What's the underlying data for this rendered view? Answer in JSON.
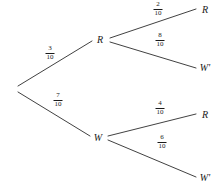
{
  "diagram": {
    "type": "probability-tree",
    "title": "",
    "background_color": "#ffffff",
    "line_color": "#2b2b2b",
    "text_color": "#1a1a1a"
  },
  "nodes": {
    "root": {
      "label": "",
      "x": 15,
      "y": 89
    },
    "level1": [
      {
        "id": "R",
        "label": "R",
        "x": 100,
        "y": 40
      },
      {
        "id": "W",
        "label": "W",
        "x": 98,
        "y": 138
      }
    ],
    "level2": [
      {
        "id": "R-R",
        "label": "R",
        "x": 205,
        "y": 10
      },
      {
        "id": "R-Wp",
        "label": "W'",
        "x": 205,
        "y": 68
      },
      {
        "id": "W-R",
        "label": "R",
        "x": 205,
        "y": 115
      },
      {
        "id": "W-Wp",
        "label": "W'",
        "x": 205,
        "y": 178
      }
    ]
  },
  "branches": [
    {
      "id": "root-to-R",
      "from": "root",
      "to": "R",
      "numerator": "3",
      "denominator": "10",
      "value": 0.3,
      "label_x": 50,
      "label_y": 53,
      "x1": 18,
      "y1": 86,
      "x2": 92,
      "y2": 41
    },
    {
      "id": "root-to-W",
      "from": "root",
      "to": "W",
      "numerator": "7",
      "denominator": "10",
      "value": 0.7,
      "label_x": 58,
      "label_y": 100,
      "x1": 18,
      "y1": 92,
      "x2": 90,
      "y2": 136
    },
    {
      "id": "R-to-R",
      "from": "R",
      "to": "R-R",
      "numerator": "2",
      "denominator": "10",
      "value": 0.2,
      "label_x": 158,
      "label_y": 9,
      "x1": 110,
      "y1": 38,
      "x2": 196,
      "y2": 9
    },
    {
      "id": "R-to-Wp",
      "from": "R",
      "to": "R-Wp",
      "numerator": "8",
      "denominator": "10",
      "value": 0.8,
      "label_x": 160,
      "label_y": 40,
      "x1": 110,
      "y1": 42,
      "x2": 196,
      "y2": 68
    },
    {
      "id": "W-to-R",
      "from": "W",
      "to": "W-R",
      "numerator": "4",
      "denominator": "10",
      "value": 0.4,
      "label_x": 160,
      "label_y": 108,
      "x1": 108,
      "y1": 136,
      "x2": 196,
      "y2": 114
    },
    {
      "id": "W-to-Wp",
      "from": "W",
      "to": "W-Wp",
      "numerator": "6",
      "denominator": "10",
      "value": 0.6,
      "label_x": 162,
      "label_y": 142,
      "x1": 108,
      "y1": 140,
      "x2": 196,
      "y2": 177
    }
  ]
}
